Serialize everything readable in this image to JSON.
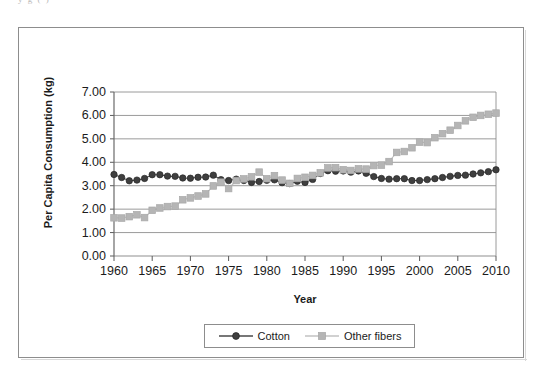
{
  "top_fragment": "y  g (  )",
  "figure": {
    "name": "per-capita-fiber-consumption-chart"
  },
  "legend": {
    "position": "bottom",
    "entries": [
      {
        "label": "Cotton",
        "marker": "circle",
        "color": "#3f3f3f",
        "line_color": "#4a4a4a"
      },
      {
        "label": "Other fibers",
        "marker": "square",
        "color": "#b5b5b5",
        "line_color": "#bdbdbd"
      }
    ]
  },
  "chart_data": {
    "type": "line",
    "title": "",
    "subtitle": "",
    "xlabel": "Year",
    "ylabel": "Per Capita Consumption (kg)",
    "xlim": [
      1960,
      2010
    ],
    "ylim": [
      0.0,
      7.0
    ],
    "ytick_labels": [
      "0.00",
      "1.00",
      "2.00",
      "3.00",
      "4.00",
      "5.00",
      "6.00",
      "7.00"
    ],
    "ytick_values": [
      0,
      1,
      2,
      3,
      4,
      5,
      6,
      7
    ],
    "xtick_labels": [
      "1960",
      "1965",
      "1970",
      "1975",
      "1980",
      "1985",
      "1990",
      "1995",
      "2000",
      "2005",
      "2010"
    ],
    "xtick_values": [
      1960,
      1965,
      1970,
      1975,
      1980,
      1985,
      1990,
      1995,
      2000,
      2005,
      2010
    ],
    "grid": "horizontal",
    "x": [
      1960,
      1961,
      1962,
      1963,
      1964,
      1965,
      1966,
      1967,
      1968,
      1969,
      1970,
      1971,
      1972,
      1973,
      1974,
      1975,
      1976,
      1977,
      1978,
      1979,
      1980,
      1981,
      1982,
      1983,
      1984,
      1985,
      1986,
      1987,
      1988,
      1989,
      1990,
      1991,
      1992,
      1993,
      1994,
      1995,
      1996,
      1997,
      1998,
      1999,
      2000,
      2001,
      2002,
      2003,
      2004,
      2005,
      2006,
      2007,
      2008,
      2009,
      2010
    ],
    "series": [
      {
        "name": "Cotton",
        "values": [
          3.48,
          3.35,
          3.21,
          3.24,
          3.31,
          3.47,
          3.47,
          3.41,
          3.4,
          3.33,
          3.32,
          3.36,
          3.37,
          3.45,
          3.26,
          3.22,
          3.28,
          3.22,
          3.14,
          3.18,
          3.23,
          3.25,
          3.13,
          3.09,
          3.19,
          3.14,
          3.27,
          3.52,
          3.64,
          3.62,
          3.63,
          3.58,
          3.63,
          3.53,
          3.39,
          3.31,
          3.28,
          3.3,
          3.3,
          3.22,
          3.22,
          3.26,
          3.3,
          3.35,
          3.4,
          3.44,
          3.45,
          3.5,
          3.55,
          3.6,
          3.68
        ]
      },
      {
        "name": "Other fibers",
        "values": [
          1.63,
          1.62,
          1.68,
          1.76,
          1.64,
          1.95,
          2.05,
          2.11,
          2.13,
          2.4,
          2.48,
          2.56,
          2.65,
          2.99,
          3.15,
          2.88,
          3.22,
          3.29,
          3.38,
          3.58,
          3.3,
          3.43,
          3.24,
          3.1,
          3.31,
          3.36,
          3.44,
          3.55,
          3.76,
          3.77,
          3.68,
          3.65,
          3.72,
          3.71,
          3.86,
          3.88,
          4.03,
          4.42,
          4.46,
          4.62,
          4.86,
          4.84,
          5.05,
          5.22,
          5.37,
          5.57,
          5.77,
          5.92,
          6.0,
          6.05,
          6.1
        ]
      }
    ]
  }
}
